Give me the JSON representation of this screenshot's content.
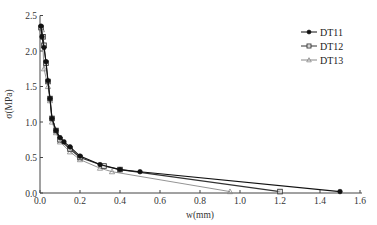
{
  "chart_data": {
    "type": "line",
    "title": "",
    "xlabel": "w(mm)",
    "ylabel": "σ(MPa)",
    "xlim": [
      0,
      1.6
    ],
    "ylim": [
      0,
      2.5
    ],
    "xticks": [
      "0.0",
      "0.2",
      "0.4",
      "0.6",
      "0.8",
      "1.0",
      "1.2",
      "1.4",
      "1.6"
    ],
    "yticks": [
      "0.0",
      "0.5",
      "1.0",
      "1.5",
      "2.0",
      "2.5"
    ],
    "grid": false,
    "legend_position": "upper right",
    "series": [
      {
        "name": "DT11",
        "marker": "filled-circle",
        "color": "#111111",
        "x": [
          0.005,
          0.01,
          0.02,
          0.03,
          0.04,
          0.05,
          0.06,
          0.08,
          0.1,
          0.12,
          0.15,
          0.2,
          0.3,
          0.4,
          0.5,
          1.5
        ],
        "y": [
          2.35,
          2.2,
          2.05,
          1.85,
          1.58,
          1.33,
          1.05,
          0.88,
          0.78,
          0.72,
          0.65,
          0.52,
          0.4,
          0.33,
          0.3,
          0.02
        ]
      },
      {
        "name": "DT12",
        "marker": "open-square",
        "color": "#333333",
        "x": [
          0.005,
          0.015,
          0.02,
          0.03,
          0.04,
          0.05,
          0.06,
          0.08,
          0.1,
          0.15,
          0.2,
          0.32,
          0.4,
          1.2
        ],
        "y": [
          2.33,
          2.2,
          2.08,
          1.83,
          1.57,
          1.33,
          1.05,
          0.88,
          0.75,
          0.62,
          0.5,
          0.38,
          0.33,
          0.02
        ]
      },
      {
        "name": "DT13",
        "marker": "open-triangle",
        "color": "#888888",
        "x": [
          0.01,
          0.02,
          0.04,
          0.05,
          0.06,
          0.08,
          0.1,
          0.15,
          0.2,
          0.3,
          0.36,
          0.95
        ],
        "y": [
          2.3,
          1.75,
          1.5,
          1.3,
          1.0,
          0.85,
          0.72,
          0.58,
          0.47,
          0.35,
          0.3,
          0.02
        ]
      }
    ]
  }
}
